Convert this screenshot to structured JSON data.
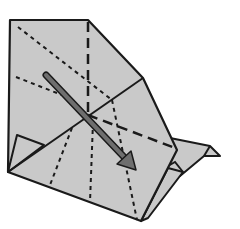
{
  "diagram": {
    "type": "origami-fold-step",
    "colors": {
      "paper": "#c9c9c9",
      "edge": "#1a1a1a",
      "arrow_fill": "#6e6e6e",
      "arrow_stroke": "#1a1a1a",
      "background": "#ffffff"
    },
    "arrow": {
      "from": [
        46,
        75
      ],
      "to": [
        133,
        166
      ],
      "meaning": "fold-direction"
    }
  }
}
